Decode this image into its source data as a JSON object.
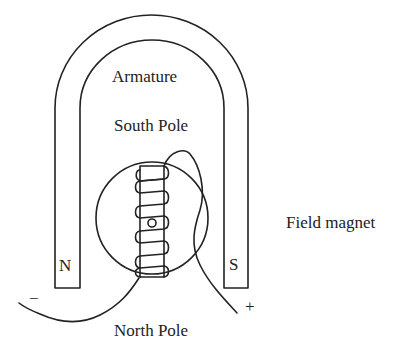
{
  "diagram": {
    "labels": {
      "armature": "Armature",
      "south_pole": "South Pole",
      "north_pole": "North Pole",
      "field_magnet": "Field magnet",
      "n_pole_letter": "N",
      "s_pole_letter": "S",
      "negative_terminal": "−",
      "positive_terminal": "+"
    },
    "colors": {
      "stroke": "#222222",
      "background": "#ffffff"
    }
  }
}
